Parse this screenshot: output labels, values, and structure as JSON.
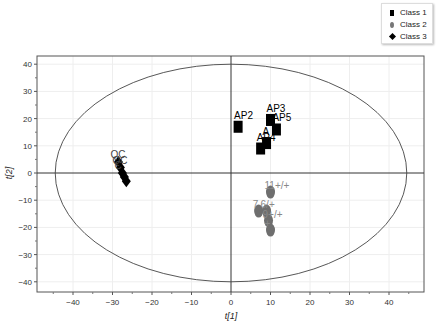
{
  "chart_data": {
    "type": "scatter",
    "title": "",
    "xlabel": "t[1]",
    "ylabel": "t[2]",
    "xlim": [
      -48,
      49
    ],
    "ylim": [
      -43,
      43
    ],
    "xticks": [
      -40,
      -30,
      -20,
      -10,
      0,
      10,
      20,
      30,
      40
    ],
    "yticks": [
      -40,
      -30,
      -20,
      -10,
      0,
      10,
      20,
      30,
      40
    ],
    "grid": true,
    "legend_position": "top-right",
    "hotelling_ellipse": {
      "cx": 0,
      "cy": 0,
      "rx": 44.5,
      "ry": 40
    },
    "series": [
      {
        "name": "Class 1",
        "marker": "square",
        "color": "#000000",
        "points": [
          {
            "label": "AP2",
            "x": 1.8,
            "y": 17
          },
          {
            "label": "AP3",
            "x": 10,
            "y": 19.5
          },
          {
            "label": "AP5",
            "x": 11.5,
            "y": 16
          },
          {
            "label": "A",
            "x": 9,
            "y": 11
          },
          {
            "label": "AP4",
            "x": 7.5,
            "y": 9
          }
        ]
      },
      {
        "name": "Class 2",
        "marker": "oval",
        "color": "#6e6e6e",
        "points": [
          {
            "label": "11+/+",
            "x": 10,
            "y": -7
          },
          {
            "label": "7",
            "x": 7,
            "y": -14
          },
          {
            "label": "6/+",
            "x": 9,
            "y": -14
          },
          {
            "label": "9+/+",
            "x": 9.5,
            "y": -17.5
          },
          {
            "label": "+",
            "x": 10,
            "y": -21
          }
        ]
      },
      {
        "name": "Class 3",
        "marker": "diamond",
        "color": "#000000",
        "points": [
          {
            "label": "QC",
            "x": -28.5,
            "y": 4
          },
          {
            "label": "QC",
            "x": -28,
            "y": 2
          },
          {
            "label": "C",
            "x": -27.5,
            "y": 0
          },
          {
            "label": "",
            "x": -27,
            "y": -1.5
          },
          {
            "label": "",
            "x": -26.5,
            "y": -3
          }
        ]
      }
    ]
  },
  "legend": {
    "items": [
      {
        "label": "Class 1",
        "symbol": "square"
      },
      {
        "label": "Class 2",
        "symbol": "oval"
      },
      {
        "label": "Class 3",
        "symbol": "diamond"
      }
    ]
  }
}
